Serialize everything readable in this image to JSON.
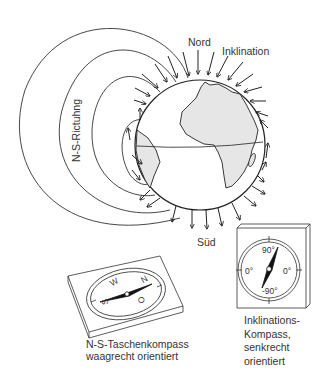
{
  "diagram": {
    "labels": {
      "north": "Nord",
      "inclination": "Inklination",
      "ns_direction": "N-S-Rictuhng",
      "south": "Süd"
    },
    "pocket_compass": {
      "caption_line1": "N-S-Taschenkompass",
      "caption_line2": "waagrecht orientiert",
      "directions": {
        "n": "N",
        "o": "O",
        "s": "S",
        "w": "W"
      }
    },
    "inclination_compass": {
      "caption_line1": "Inklinations-",
      "caption_line2": "Kompass,",
      "caption_line3": "senkrecht",
      "caption_line4": "orientiert",
      "scale": {
        "top": "90°",
        "left": "0°",
        "right": "0°",
        "bottom": "-90°"
      }
    },
    "colors": {
      "line": "#222222",
      "land": "#e6e6e6",
      "background": "#ffffff"
    }
  }
}
